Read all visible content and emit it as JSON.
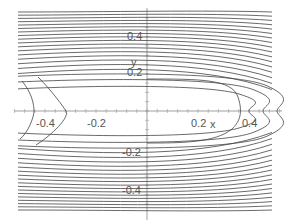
{
  "chart_data": {
    "type": "contour",
    "title": "",
    "xlabel": "x",
    "ylabel": "y",
    "xlim": [
      -0.53,
      0.53
    ],
    "ylim": [
      -0.5,
      0.5
    ],
    "x_ticks": [
      -0.4,
      -0.2,
      0.2,
      0.4
    ],
    "y_ticks": [
      0.4,
      0.2,
      -0.2,
      -0.4
    ],
    "x_tick_labels": [
      "-0.4",
      "-0.2",
      "0.2",
      "0.4"
    ],
    "y_tick_labels": [
      "0.4",
      "0.2",
      "-0.2",
      "-0.4"
    ],
    "grid": false,
    "legend": null,
    "line_color": "#444444"
  },
  "axes": {
    "x_label": "x",
    "y_label": "y"
  }
}
